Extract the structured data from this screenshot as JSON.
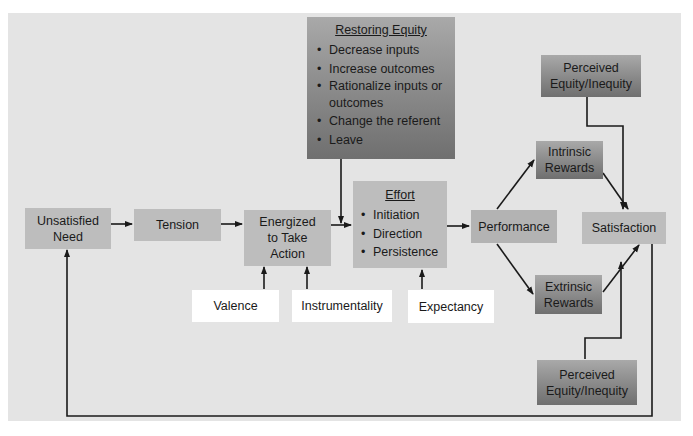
{
  "diagram": {
    "nodes": {
      "unsatisfied_need": "Unsatisfied Need",
      "tension": "Tension",
      "energized": "Energized to Take Action",
      "effort": {
        "title": "Effort",
        "items": [
          "Initiation",
          "Direction",
          "Persistence"
        ]
      },
      "restoring_equity": {
        "title": "Restoring Equity",
        "items": [
          "Decrease inputs",
          "Increase outcomes",
          "Rationalize inputs or outcomes",
          "Change the referent",
          "Leave"
        ]
      },
      "performance": "Performance",
      "intrinsic_rewards": "Intrinsic Rewards",
      "extrinsic_rewards": "Extrinsic Rewards",
      "satisfaction": "Satisfaction",
      "perceived_equity_top": "Perceived Equity/Inequity",
      "perceived_equity_bottom": "Perceived Equity/Inequity",
      "valence": "Valence",
      "instrumentality": "Instrumentality",
      "expectancy": "Expectancy"
    },
    "edges": [
      [
        "unsatisfied_need",
        "tension"
      ],
      [
        "tension",
        "energized"
      ],
      [
        "energized",
        "effort"
      ],
      [
        "restoring_equity",
        "energized->effort"
      ],
      [
        "effort",
        "performance"
      ],
      [
        "performance",
        "intrinsic_rewards"
      ],
      [
        "performance",
        "extrinsic_rewards"
      ],
      [
        "intrinsic_rewards",
        "satisfaction"
      ],
      [
        "extrinsic_rewards",
        "satisfaction"
      ],
      [
        "perceived_equity_top",
        "satisfaction"
      ],
      [
        "perceived_equity_bottom",
        "satisfaction"
      ],
      [
        "valence",
        "energized"
      ],
      [
        "instrumentality",
        "energized"
      ],
      [
        "expectancy",
        "effort"
      ],
      [
        "satisfaction",
        "unsatisfied_need"
      ]
    ],
    "colors": {
      "panel": "#e4e4e4",
      "flat_box": "#bdbdbd",
      "gradient_top": "#a9a9a9",
      "gradient_bottom": "#6f6f6f",
      "line": "#1a1a1a"
    }
  }
}
